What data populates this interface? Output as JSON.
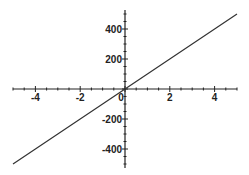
{
  "chart_data": {
    "type": "line",
    "title": "",
    "xlabel": "",
    "ylabel": "",
    "xlim": [
      -5,
      5
    ],
    "ylim": [
      -500,
      500
    ],
    "grid": false,
    "legend": null,
    "x_ticks": [
      -4,
      -2,
      0,
      2,
      4
    ],
    "x_tick_labels": [
      "-4",
      "-2",
      "0",
      "2",
      "4"
    ],
    "y_ticks": [
      400,
      200,
      -200,
      -400
    ],
    "y_tick_labels": [
      "400",
      "200",
      "-200",
      "-400"
    ],
    "series": [
      {
        "name": "y = 100x",
        "x": [
          -5,
          -4,
          -3,
          -2,
          -1,
          0,
          1,
          2,
          3,
          4,
          5
        ],
        "values": [
          -500,
          -400,
          -300,
          -200,
          -100,
          0,
          100,
          200,
          300,
          400,
          500
        ],
        "color": "#333333"
      }
    ],
    "axes_style": "crossing-at-origin"
  },
  "colors": {
    "axis": "#222222",
    "line": "#333333",
    "background": "#ffffff"
  }
}
